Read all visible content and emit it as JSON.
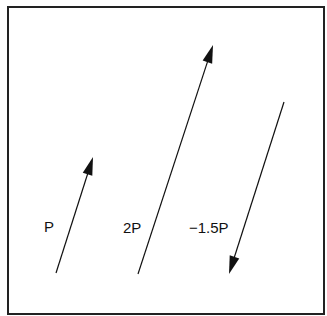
{
  "diagram": {
    "title": "",
    "vectors": [
      {
        "label": "P",
        "tail": [
          56,
          273
        ],
        "tip": [
          93,
          157
        ],
        "label_pos": [
          44,
          232
        ]
      },
      {
        "label": "2P",
        "tail": [
          138,
          274
        ],
        "tip": [
          213,
          45
        ],
        "label_pos": [
          123,
          233
        ]
      },
      {
        "label": "−1.5P",
        "tail": [
          284,
          102
        ],
        "tip": [
          229,
          274
        ],
        "label_pos": [
          189,
          233
        ]
      }
    ],
    "colors": {
      "stroke": "#111111",
      "border": "#222222",
      "background": "#ffffff"
    }
  }
}
